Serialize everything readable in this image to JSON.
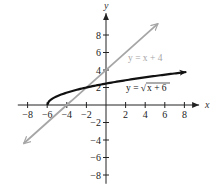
{
  "chart_data": {
    "type": "line",
    "title": "",
    "xlabel": "x",
    "ylabel": "y",
    "xlim": [
      -9,
      9.5
    ],
    "ylim": [
      -9,
      10.5
    ],
    "x_ticks": [
      -8,
      -6,
      -4,
      -2,
      2,
      4,
      6,
      8
    ],
    "y_ticks": [
      -8,
      -6,
      -4,
      -2,
      2,
      4,
      6,
      8
    ],
    "x_tick_labels": [
      "−8",
      "−6",
      "−4",
      "−2",
      "2",
      "4",
      "6",
      "8"
    ],
    "y_tick_labels": [
      "−8",
      "−6",
      "−4",
      "−2",
      "2",
      "4",
      "6",
      "8"
    ],
    "grid": false,
    "series": [
      {
        "name": "y = x + 4",
        "label": "y = x + 4",
        "function": "x + 4",
        "domain": [
          -8.4,
          5.3
        ],
        "color": "#a6a6a6",
        "arrows": "both"
      },
      {
        "name": "y = √(x + 6)",
        "label": "y = √x + 6",
        "function": "sqrt(x + 6)",
        "domain": [
          -6,
          8.2
        ],
        "color": "#111111",
        "arrows": "end",
        "start_point": [
          -6,
          0
        ]
      }
    ],
    "annotations": [
      {
        "text": "y = x + 4",
        "near": [
          6.5,
          6.5
        ],
        "color": "#a6a6a6"
      },
      {
        "text": "y = √(x + 6)",
        "near": [
          6.5,
          1.5
        ],
        "color": "#111111"
      }
    ]
  }
}
